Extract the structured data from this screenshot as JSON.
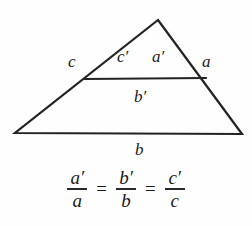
{
  "figure": {
    "background_color": "#fefefe",
    "stroke_color": "#232323",
    "text_color": "#1b1b1b",
    "triangle": {
      "apex": [
        158,
        20
      ],
      "bottom_left": [
        15,
        133
      ],
      "bottom_right": [
        242,
        134
      ],
      "midline_left": [
        85,
        79
      ],
      "midline_right": [
        206,
        78
      ],
      "stroke_width": 2.2
    },
    "labels": {
      "side_c": "c",
      "side_c_prime": "c′",
      "side_a_prime": "a′",
      "side_a": "a",
      "side_b_prime": "b′",
      "side_b": "b"
    }
  },
  "equation": {
    "fraction_1": {
      "numerator": "a′",
      "denominator": "a"
    },
    "equals_1": "=",
    "fraction_2": {
      "numerator": "b′",
      "denominator": "b"
    },
    "equals_2": "=",
    "fraction_3": {
      "numerator": "c′",
      "denominator": "c"
    },
    "full_text": "a′/a = b′/b = c′/c"
  }
}
